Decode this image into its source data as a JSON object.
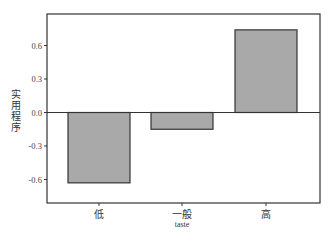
{
  "chart_data": {
    "type": "bar",
    "title": "",
    "xlabel": "taste",
    "ylabel": "实用程序",
    "categories": [
      "低",
      "一般",
      "高"
    ],
    "values": [
      -0.63,
      -0.15,
      0.74
    ],
    "ylim": [
      -0.8,
      0.88
    ],
    "yticks": [
      -0.6,
      -0.3,
      0.0,
      0.3,
      0.6
    ],
    "ytick_labels": [
      "-0.6",
      "-0.3",
      "0.0",
      "0.3",
      "0.6"
    ],
    "grid": false,
    "legend": null,
    "zero_line": true,
    "colors": {
      "bar_fill": "#a9a9a9",
      "bar_edge": "#333333",
      "axis": "#333333"
    }
  }
}
